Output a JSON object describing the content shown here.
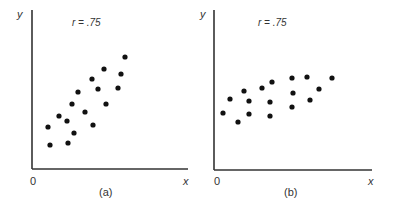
{
  "chart_data": [
    {
      "type": "scatter",
      "title": "r = .75",
      "caption": "(a)",
      "xlabel": "x",
      "ylabel": "y",
      "origin_label": "0",
      "grid": false,
      "annotation": "r = .75",
      "points": [
        [
          50,
          145
        ],
        [
          68,
          143
        ],
        [
          48,
          127
        ],
        [
          74,
          133
        ],
        [
          59,
          116
        ],
        [
          67,
          121
        ],
        [
          72,
          104
        ],
        [
          85,
          112
        ],
        [
          93,
          125
        ],
        [
          78,
          92
        ],
        [
          98,
          89
        ],
        [
          106,
          104
        ],
        [
          92,
          79
        ],
        [
          104,
          69
        ],
        [
          118,
          88
        ],
        [
          121,
          74
        ],
        [
          125,
          57
        ]
      ]
    },
    {
      "type": "scatter",
      "title": "r = .75",
      "caption": "(b)",
      "xlabel": "x",
      "ylabel": "y",
      "origin_label": "0",
      "grid": false,
      "annotation": "r = .75",
      "points": [
        [
          223,
          113
        ],
        [
          238,
          122
        ],
        [
          230,
          99
        ],
        [
          244,
          91
        ],
        [
          249,
          101
        ],
        [
          249,
          114
        ],
        [
          262,
          88
        ],
        [
          272,
          82
        ],
        [
          270,
          102
        ],
        [
          270,
          116
        ],
        [
          292,
          78
        ],
        [
          293,
          93
        ],
        [
          292,
          107
        ],
        [
          307,
          77
        ],
        [
          319,
          89
        ],
        [
          310,
          100
        ],
        [
          332,
          78
        ]
      ]
    }
  ],
  "panels": [
    {
      "y_label": "y",
      "x_label": "x",
      "origin": "0",
      "r_text": "r = .75",
      "caption": "(a)"
    },
    {
      "y_label": "y",
      "x_label": "x",
      "origin": "0",
      "r_text": "r = .75",
      "caption": "(b)"
    }
  ]
}
